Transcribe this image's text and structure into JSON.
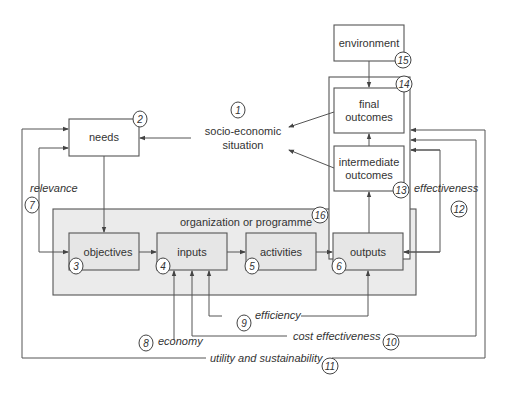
{
  "diagram": {
    "nodes": {
      "environment": {
        "label": "environment",
        "num": "15"
      },
      "outcomes_group": {
        "num": "14"
      },
      "final_outcomes": {
        "label_1": "final",
        "label_2": "outcomes"
      },
      "intermediate_outcomes": {
        "label_1": "intermediate",
        "label_2": "outcomes",
        "num": "13"
      },
      "socio_economic": {
        "label_1": "socio-economic",
        "label_2": "situation",
        "num": "1"
      },
      "needs": {
        "label": "needs",
        "num": "2"
      },
      "organization": {
        "label": "organization or programme",
        "num": "16"
      },
      "objectives": {
        "label": "objectives",
        "num": "3"
      },
      "inputs": {
        "label": "inputs",
        "num": "4"
      },
      "activities": {
        "label": "activities",
        "num": "5"
      },
      "outputs": {
        "label": "outputs",
        "num": "6"
      }
    },
    "criteria": {
      "relevance": {
        "label": "relevance",
        "num": "7"
      },
      "economy": {
        "label": "economy",
        "num": "8"
      },
      "efficiency": {
        "label": "efficiency",
        "num": "9"
      },
      "cost_effectiveness": {
        "label": "cost effectiveness",
        "num": "10"
      },
      "utility": {
        "label": "utility and sustainability",
        "num": "11"
      },
      "effectiveness": {
        "label": "effectiveness",
        "num": "12"
      }
    },
    "colors": {
      "line": "#555555",
      "programme_fill": "#ebebeb",
      "box_fill": "#ffffff"
    }
  }
}
